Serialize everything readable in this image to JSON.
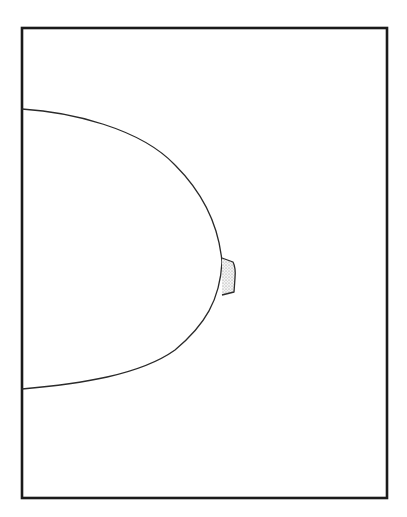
{
  "diagram": {
    "type": "line-art",
    "canvas": {
      "width": 407,
      "height": 517,
      "background": "#ffffff"
    },
    "frame": {
      "x": 22,
      "y": 28,
      "width": 365,
      "height": 470,
      "stroke": "#1a1a1a",
      "stroke_width": 2.6
    },
    "outline": {
      "stroke": "#2a2a2a",
      "stroke_width": 1.3,
      "path": "M 22 109 C 70 112, 140 128, 175 165 C 205 195, 219 228, 222 262 C 220 300, 205 325, 175 350 C 140 375, 80 384, 22 389"
    },
    "nipple": {
      "path": "M 222 258 L 233 262 Q 236 268 235 278 L 234 292 L 222 295",
      "fill": "#e6e6e6",
      "stroke": "#2a2a2a",
      "stroke_width": 1.3,
      "shading": "stippled"
    },
    "labels": []
  }
}
